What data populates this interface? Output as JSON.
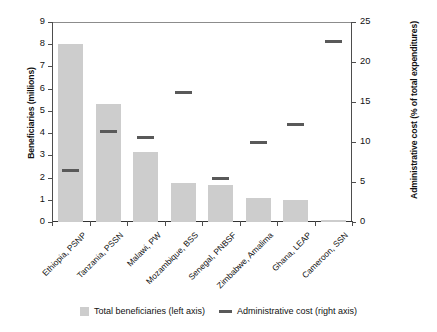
{
  "chart_data": {
    "type": "bar",
    "title": "",
    "categories": [
      "Ethiopia, PSNP",
      "Tanzania, PSSN",
      "Malawi, PW",
      "Mozambique, BSS",
      "Senegal, PNBSF",
      "Zimbabwe, Amalima",
      "Ghana, LEAP",
      "Cameroon, SSN"
    ],
    "series": [
      {
        "name": "Total beneficiaries (left axis)",
        "axis": "left",
        "render": "bar",
        "color": "#cdcdcd",
        "values": [
          8.0,
          5.3,
          3.15,
          1.75,
          1.65,
          1.1,
          1.0,
          0.08
        ]
      },
      {
        "name": "Administrative cost (right axis)",
        "axis": "right",
        "render": "marker",
        "color": "#595959",
        "values": [
          6.4,
          11.3,
          10.6,
          16.2,
          5.4,
          10.0,
          12.2,
          22.6
        ]
      }
    ],
    "xlabel": "",
    "ylabel": "Beneficiaries (millions)",
    "y2label": "Administrative cost (% of total expenditures)",
    "ylim": [
      0,
      9
    ],
    "y2lim": [
      0,
      25
    ],
    "yticks": [
      "0",
      "1",
      "2",
      "3",
      "4",
      "5",
      "6",
      "7",
      "8",
      "9"
    ],
    "y2ticks": [
      "0",
      "5",
      "10",
      "15",
      "20",
      "25"
    ],
    "grid": false,
    "legend_position": "bottom"
  },
  "legend": {
    "items": [
      {
        "label": "Total beneficiaries (left axis)",
        "marker": "square-swatch"
      },
      {
        "label": "Administrative cost (right axis)",
        "marker": "line-swatch"
      }
    ]
  }
}
